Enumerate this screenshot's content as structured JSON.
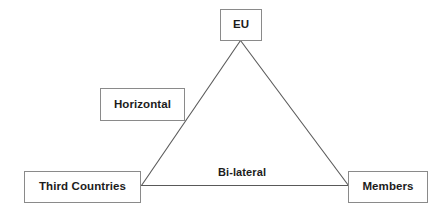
{
  "diagram": {
    "type": "triangle-relationship-diagram",
    "background_color": "#ffffff",
    "line_color": "#595959",
    "box_border_color": "#8a8a8a",
    "text_color": "#1c1c1c",
    "nodes": [
      {
        "id": "eu",
        "label": "EU"
      },
      {
        "id": "horizontal",
        "label": "Horizontal"
      },
      {
        "id": "third_countries",
        "label": "Third Countries"
      },
      {
        "id": "members",
        "label": "Members"
      }
    ],
    "edges": [
      {
        "id": "eu_third_countries",
        "from": "eu",
        "to": "third_countries",
        "label": ""
      },
      {
        "id": "eu_members",
        "from": "eu",
        "to": "members",
        "label": ""
      },
      {
        "id": "third_countries_members",
        "from": "third_countries",
        "to": "members",
        "label": "Bi-lateral"
      }
    ],
    "edge_labels": {
      "bilateral": "Bi-lateral"
    }
  }
}
